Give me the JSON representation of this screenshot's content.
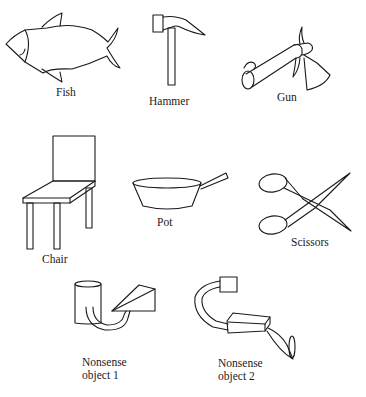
{
  "figure": {
    "items": [
      {
        "id": "fish",
        "label": "Fish"
      },
      {
        "id": "hammer",
        "label": "Hammer"
      },
      {
        "id": "gun",
        "label": "Gun"
      },
      {
        "id": "chair",
        "label": "Chair"
      },
      {
        "id": "pot",
        "label": "Pot"
      },
      {
        "id": "scissors",
        "label": "Scissors"
      },
      {
        "id": "nonsense1",
        "label_line1": "Nonsense",
        "label_line2": "object 1"
      },
      {
        "id": "nonsense2",
        "label_line1": "Nonsense",
        "label_line2": "object 2"
      }
    ],
    "colors": {
      "ink": "#1a1a1a",
      "background": "#ffffff"
    }
  }
}
